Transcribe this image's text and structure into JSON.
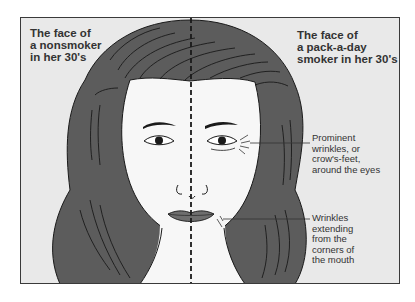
{
  "diagram": {
    "left_label": "The face of\na nonsmoker\nin her 30's",
    "right_label": "The face of\na pack-a-day\nsmoker in her 30's",
    "callouts": [
      {
        "text": "Prominent\nwrinkles, or\ncrow's-feet,\naround the eyes",
        "target": "eye wrinkles"
      },
      {
        "text": "Wrinkles\nextending\nfrom the\ncorners of\nthe mouth",
        "target": "mouth wrinkles"
      }
    ],
    "colors": {
      "background": "#e9e9e9",
      "hair": "#5c5c5c",
      "lips": "#6e6e6e",
      "skin": "#f7f7f7",
      "outline": "#1a1a1a",
      "text": "#333333"
    }
  }
}
